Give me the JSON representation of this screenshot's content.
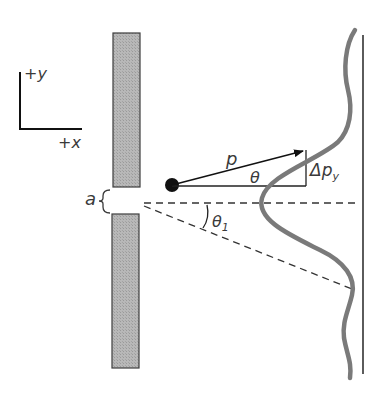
{
  "diagram": {
    "axes": {
      "y_label": "+y",
      "x_label": "+x"
    },
    "slit": {
      "width_label": "a"
    },
    "particle": {
      "momentum_label": "p",
      "angle_label": "θ",
      "delta_label": "Δp",
      "delta_subscript": "y"
    },
    "first_minimum": {
      "angle_label": "θ",
      "angle_subscript": "1"
    },
    "colors": {
      "barrier_fill": "#b4b4b4",
      "barrier_edge": "#3c3c3c",
      "intensity_curve": "#7a7a7a",
      "lines": "#222222"
    }
  }
}
